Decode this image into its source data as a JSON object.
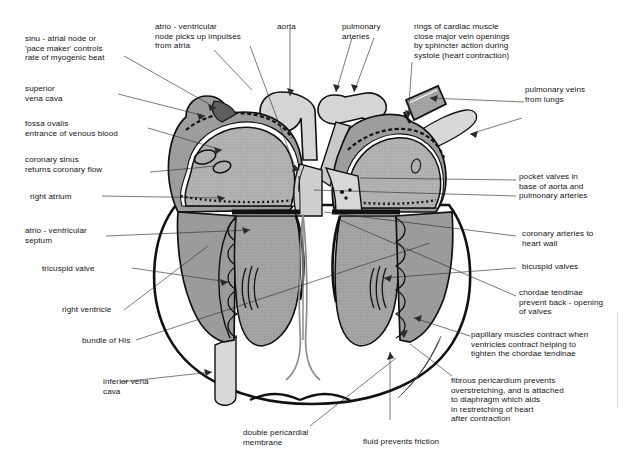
{
  "figure": {
    "type": "labelled anatomical diagram",
    "background_color": "#fefefe",
    "line_color": "#2b2b2b",
    "fills": {
      "atrium_wall": "#9a9a9a",
      "atrium_lumen": "#b9b9b9",
      "ventricle_muscle": "#a8a8a8",
      "ventricle_lumen": "#dcdcdc",
      "vessel_light": "#d5d5d5",
      "vessel_mid": "#c3c3c3",
      "sa_node": "#5e5e5e",
      "outline_dark": "#111111"
    }
  },
  "labels": {
    "sinu_atrial_node": "sinu - atrial node or\n'pace maker' controls\nrate of myogenic beat",
    "superior_vena_cava": "superior\nvena cava",
    "fossa_ovalis": "fossa ovalis\nentrance of venous blood",
    "coronary_sinus": "coronary sinus\nreturns coronary flow",
    "right_atrium": "right atrium",
    "atrio_ventricular_septum": "atrio - ventricular\nseptum",
    "tricuspid_valve": "tricuspid valve",
    "right_ventricle": "right ventricle",
    "bundle_of_his": "bundle of His",
    "inferior_vena_cava": "inferior vena\ncava",
    "atrio_ventricular_node": "atrio - ventricular\nnode picks up impulses\nfrom atria",
    "aorta": "aorta",
    "pulmonary_arteries": "pulmonary\narteries",
    "rings_of_cardiac_muscle": "rings of cardiac muscle\nclose major vein openings\nby sphincter action during\nsystole (heart contraction)",
    "pulmonary_veins": "pulmonary veins\nfrom lungs",
    "pocket_valves": "pocket valves in\nbase of aorta and\npulmonary arteries",
    "coronary_arteries": "coronary arteries to\nheart wall",
    "bicuspid_valves": "bicuspid valves",
    "chordae_tendinae": "chordae tendinae\nprevent back - opening\nof valves",
    "papillary_muscles": "papillary muscles contract when\nventricles contract helping to\ntighten the chordae tendinae",
    "fibrous_pericardium": "fibrous pericardium prevents\noverstretching, and is attached\nto diaphragm which aids\nin restretching of heart\nafter contraction",
    "double_pericardial_membrane": "double pericardial\nmembrane",
    "fluid_prevents_friction": "fluid prevents friction"
  }
}
